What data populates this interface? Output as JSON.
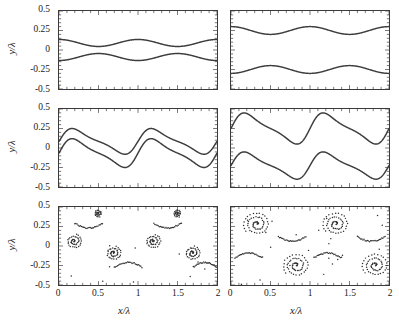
{
  "figure": {
    "layout": "3x2 grid of cartesian panels",
    "columns": 2,
    "rows": 3,
    "axis_titles": {
      "x": "x/λ",
      "y": "y/λ"
    },
    "x_tick_labels": [
      "0",
      "0.5",
      "1",
      "1.5",
      "2"
    ],
    "x_tick_values": [
      0,
      0.5,
      1,
      1.5,
      2
    ],
    "y_tick_labels": [
      "0.5",
      "0.25",
      "0",
      "-0.25",
      "-0.5"
    ],
    "y_tick_values": [
      0.5,
      0.25,
      0,
      -0.25,
      -0.5
    ],
    "x_minor_step": 0.1,
    "y_minor_step": 0.05,
    "colors": {
      "curve": "#3d3d3d",
      "marker": "#2e2e2e",
      "axis": "#3a3a3a",
      "background": "#ffffff"
    }
  },
  "chart_data": [
    {
      "id": "panel-row1-left",
      "type": "line",
      "title": "",
      "xlabel": "x/λ",
      "ylabel": "y/λ",
      "xlim": [
        0,
        2
      ],
      "ylim": [
        -0.5,
        0.5
      ],
      "grid": false,
      "legend": "none",
      "description": "Two nearly sinusoidal interface curves, small amplitude, two wave periods across the domain, symmetric about y=0",
      "series": [
        {
          "name": "upper-interface",
          "form": "sinusoid",
          "mean": 0.09,
          "amplitude": 0.045,
          "periods": 2,
          "phase_deg": 90
        },
        {
          "name": "lower-interface",
          "form": "sinusoid",
          "mean": -0.09,
          "amplitude": 0.045,
          "periods": 2,
          "phase_deg": 270
        }
      ]
    },
    {
      "id": "panel-row1-right",
      "type": "line",
      "title": "",
      "xlabel": "x/λ",
      "ylabel": "y/λ",
      "xlim": [
        0,
        2
      ],
      "ylim": [
        -0.5,
        0.5
      ],
      "grid": false,
      "legend": "none",
      "description": "Two sinusoidal interface curves with larger separation, two wave periods, symmetric about y=0",
      "series": [
        {
          "name": "upper-interface",
          "form": "sinusoid",
          "mean": 0.25,
          "amplitude": 0.05,
          "periods": 2,
          "phase_deg": 90
        },
        {
          "name": "lower-interface",
          "form": "sinusoid",
          "mean": -0.25,
          "amplitude": 0.05,
          "periods": 2,
          "phase_deg": 270
        }
      ]
    },
    {
      "id": "panel-row2-left",
      "type": "line",
      "title": "",
      "xlabel": "x/λ",
      "ylabel": "y/λ",
      "xlim": [
        0,
        2
      ],
      "ylim": [
        -0.5,
        0.5
      ],
      "grid": false,
      "legend": "none",
      "description": "Nonlinearly steepened interfaces, crests near 0.25 and troughs near -0.25, sharp near-vertical fronts, two periods",
      "series": [
        {
          "name": "upper-interface",
          "form": "steepened-wave",
          "crest": 0.25,
          "trough": -0.08,
          "periods": 2
        },
        {
          "name": "lower-interface",
          "form": "steepened-wave",
          "crest": 0.12,
          "trough": -0.25,
          "periods": 2
        }
      ]
    },
    {
      "id": "panel-row2-right",
      "type": "line",
      "title": "",
      "xlabel": "x/λ",
      "ylabel": "y/λ",
      "xlim": [
        0,
        2
      ],
      "ylim": [
        -0.5,
        0.5
      ],
      "grid": false,
      "legend": "none",
      "description": "Strongly steepened large amplitude interfaces with near-vertical fronts, crests near 0.45, troughs near -0.40, two periods",
      "series": [
        {
          "name": "upper-interface",
          "form": "steepened-wave",
          "crest": 0.45,
          "trough": 0.05,
          "periods": 2
        },
        {
          "name": "lower-interface",
          "form": "steepened-wave",
          "crest": -0.05,
          "trough": -0.4,
          "periods": 2
        }
      ]
    },
    {
      "id": "panel-row3-left",
      "type": "scatter",
      "title": "",
      "xlabel": "x/λ",
      "ylabel": "y/λ",
      "xlim": [
        0,
        2
      ],
      "ylim": [
        -0.5,
        0.5
      ],
      "grid": false,
      "legend": "none",
      "description": "Particle markers showing roll-up into six small spiral vortices linked by thin filaments",
      "vortices": [
        {
          "cx": 0.19,
          "cy": 0.06,
          "turns": 2.2,
          "r_max": 0.1,
          "n": 46
        },
        {
          "cx": 0.5,
          "cy": 0.42,
          "turns": 1.8,
          "r_max": 0.05,
          "n": 30
        },
        {
          "cx": 0.69,
          "cy": -0.09,
          "turns": 2.2,
          "r_max": 0.1,
          "n": 46
        },
        {
          "cx": 1.19,
          "cy": 0.06,
          "turns": 2.2,
          "r_max": 0.1,
          "n": 46
        },
        {
          "cx": 1.5,
          "cy": 0.42,
          "turns": 1.8,
          "r_max": 0.05,
          "n": 30
        },
        {
          "cx": 1.69,
          "cy": -0.09,
          "turns": 2.2,
          "r_max": 0.1,
          "n": 46
        }
      ],
      "filaments": [
        {
          "name": "upper-braid-1",
          "from_x": 0.2,
          "to_x": 0.55,
          "level": 0.29
        },
        {
          "name": "upper-braid-2",
          "from_x": 1.2,
          "to_x": 1.55,
          "level": 0.29
        },
        {
          "name": "lower-braid-1",
          "from_x": 0.7,
          "to_x": 1.05,
          "level": -0.27
        },
        {
          "name": "lower-braid-2",
          "from_x": 1.7,
          "to_x": 2.0,
          "level": -0.27
        }
      ]
    },
    {
      "id": "panel-row3-right",
      "type": "scatter",
      "title": "",
      "xlabel": "x/λ",
      "ylabel": "y/λ",
      "xlim": [
        0,
        2
      ],
      "ylim": [
        -0.5,
        0.5
      ],
      "grid": false,
      "legend": "none",
      "description": "Particle markers forming four large well-developed spiral vortices with connecting braids and scattered stray particles",
      "vortices": [
        {
          "cx": 0.33,
          "cy": 0.28,
          "turns": 2.6,
          "r_max": 0.17,
          "n": 62
        },
        {
          "cx": 0.83,
          "cy": -0.25,
          "turns": 2.6,
          "r_max": 0.17,
          "n": 62
        },
        {
          "cx": 1.33,
          "cy": 0.28,
          "turns": 2.6,
          "r_max": 0.17,
          "n": 62
        },
        {
          "cx": 1.83,
          "cy": -0.25,
          "turns": 2.6,
          "r_max": 0.17,
          "n": 62
        }
      ],
      "filaments": [
        {
          "name": "braid-1",
          "from_x": 0.05,
          "to_x": 0.4,
          "level": -0.15
        },
        {
          "name": "braid-2",
          "from_x": 0.6,
          "to_x": 0.95,
          "level": 0.12
        },
        {
          "name": "braid-3",
          "from_x": 1.05,
          "to_x": 1.4,
          "level": -0.15
        },
        {
          "name": "braid-4",
          "from_x": 1.6,
          "to_x": 1.95,
          "level": 0.12
        }
      ]
    }
  ]
}
